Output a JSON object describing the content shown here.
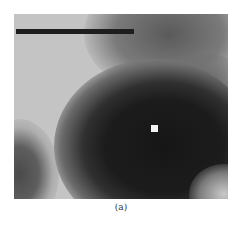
{
  "figure": {
    "panel_label": "(a)",
    "type": "grayscale intensity map",
    "scale_bar": {
      "present": true,
      "color": "#1e1e1e"
    },
    "marker": {
      "shape": "square",
      "color": "#f4f4f4"
    },
    "colors": {
      "background_light": "#c4c4c4",
      "dark_region": "#1c1c1c",
      "mid_gray": "#6a6a6a"
    }
  }
}
